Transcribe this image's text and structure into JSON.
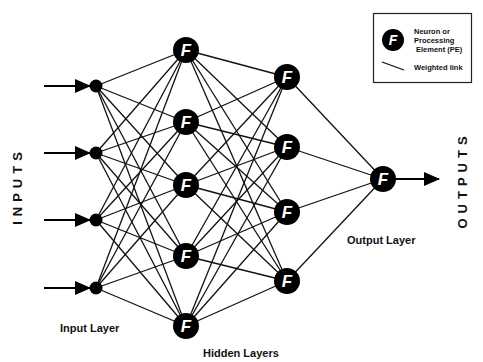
{
  "diagram": {
    "side_labels": {
      "inputs": "INPUTS",
      "outputs": "OUTPUTS"
    },
    "layer_labels": {
      "input": "Input Layer",
      "hidden": "Hidden Layers",
      "output": "Output Layer"
    },
    "neuron_glyph": "F",
    "legend": {
      "neuron_line1": "Neuron or",
      "neuron_line2": "Processing",
      "neuron_line3": "Element (PE)",
      "link": "Weighted link"
    },
    "layers": [
      {
        "name": "input",
        "x": 96,
        "nodes_y": [
          86,
          153,
          220,
          288
        ],
        "node_type": "dot"
      },
      {
        "name": "hidden1",
        "x": 186,
        "nodes_y": [
          50,
          122,
          185,
          256,
          326
        ],
        "node_type": "F"
      },
      {
        "name": "hidden2",
        "x": 287,
        "nodes_y": [
          77,
          147,
          212,
          281
        ],
        "node_type": "F"
      },
      {
        "name": "output",
        "x": 383,
        "nodes_y": [
          179
        ],
        "node_type": "F"
      }
    ],
    "connectivity": "fully-connected",
    "colors": {
      "background": "#ffffff",
      "node": "#000000",
      "line": "#111111",
      "text": "#111111"
    }
  }
}
